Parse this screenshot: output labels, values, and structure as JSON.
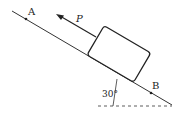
{
  "diagram": {
    "labels": {
      "point_a": "A",
      "point_b": "B",
      "force": "P",
      "angle": "30°"
    },
    "incline_angle_deg": 30,
    "colors": {
      "stroke": "#222222",
      "background": "#ffffff"
    }
  }
}
